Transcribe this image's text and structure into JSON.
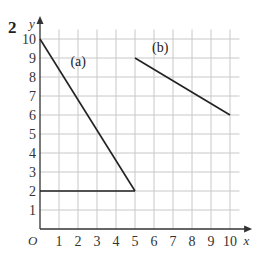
{
  "question_number": "2",
  "chart_data": {
    "type": "line",
    "title": "",
    "xlabel": "x",
    "ylabel": "y",
    "origin_label": "O",
    "xlim": [
      0,
      10
    ],
    "ylim": [
      0,
      10
    ],
    "grid": true,
    "x_ticks": [
      "1",
      "2",
      "3",
      "4",
      "5",
      "6",
      "7",
      "8",
      "9",
      "10"
    ],
    "y_ticks": [
      "1",
      "2",
      "3",
      "4",
      "5",
      "6",
      "7",
      "8",
      "9",
      "10"
    ],
    "series": [
      {
        "name": "(a)",
        "points": [
          [
            0,
            10
          ],
          [
            5,
            2
          ]
        ]
      },
      {
        "name": "(a) base",
        "points": [
          [
            0,
            2
          ],
          [
            5,
            2
          ]
        ]
      },
      {
        "name": "(b)",
        "points": [
          [
            5,
            9
          ],
          [
            10,
            6
          ]
        ]
      }
    ],
    "annotations": [
      {
        "text": "(a)",
        "x": 1.6,
        "y": 8.6
      },
      {
        "text": "(b)",
        "x": 5.9,
        "y": 9.3
      }
    ]
  }
}
